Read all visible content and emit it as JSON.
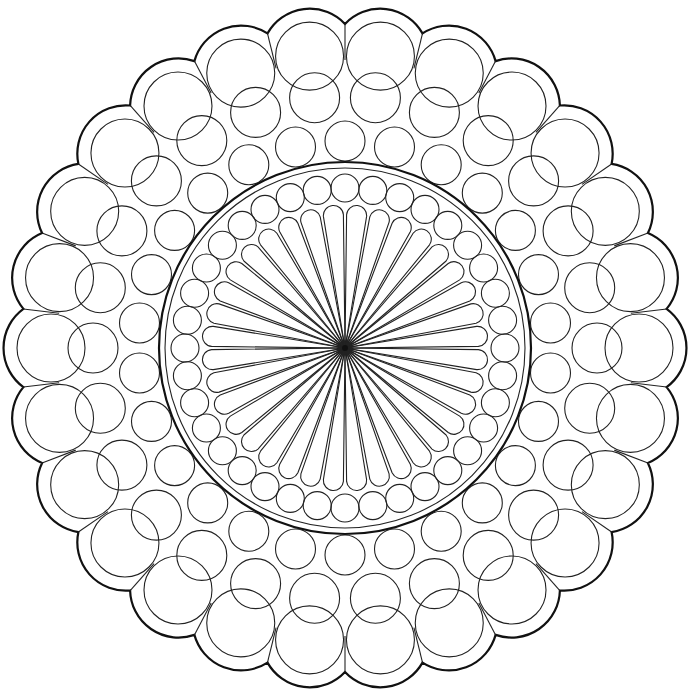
{
  "figure": {
    "type": "line-art rosette / rose window mandala",
    "width": 691,
    "height": 695,
    "background": "#ffffff",
    "stroke_color": "#222222",
    "center": [
      345,
      348
    ]
  },
  "rings": {
    "outer_scallops": {
      "count": 26,
      "outer_radius": 332,
      "inner_radius": 282
    },
    "outer_circles": {
      "count": 26,
      "orbit_radius": 252,
      "circle_radius": 25
    },
    "middle_circles": {
      "count": 26,
      "orbit_radius": 207,
      "circle_radius": 20,
      "phase_offset_half_step": true
    },
    "band": {
      "outer_radius": 186,
      "inner_radius": 180
    },
    "inner_circles": {
      "count": 36,
      "orbit_radius": 160,
      "circle_radius": 14
    },
    "petals": {
      "count": 36,
      "tip_radius": 143,
      "petal_half_width": 10
    }
  }
}
